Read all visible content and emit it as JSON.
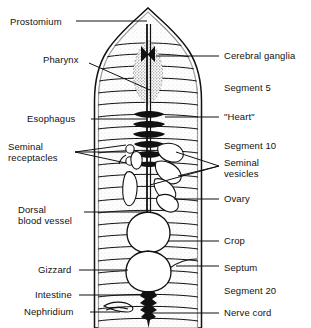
{
  "figure": {
    "organism": "earthworm",
    "view": "dorsal dissection",
    "ink_color": "#111111",
    "background_color": "#ffffff",
    "stipple_color": "#6e6e6e"
  },
  "labels_left": [
    {
      "id": "prostomium",
      "text": "Prostomium",
      "x": 10,
      "y": 16,
      "leader": "straight"
    },
    {
      "id": "pharynx",
      "text": "Pharynx",
      "x": 43,
      "y": 59,
      "leader": "diagonal"
    },
    {
      "id": "esophagus",
      "text": "Esophagus",
      "x": 27,
      "y": 114,
      "leader": "straight"
    },
    {
      "id": "seminal-receptacles",
      "text": "Seminal\nreceptacles",
      "x": 8,
      "y": 141,
      "leader": "fan3"
    },
    {
      "id": "dorsal-blood-vessel",
      "text": "Dorsal\nblood vessel",
      "x": 18,
      "y": 206,
      "leader": "straight"
    },
    {
      "id": "gizzard",
      "text": "Gizzard",
      "x": 38,
      "y": 265,
      "leader": "straight"
    },
    {
      "id": "intestine",
      "text": "Intestine",
      "x": 35,
      "y": 290,
      "leader": "straight"
    },
    {
      "id": "nephridium",
      "text": "Nephridium",
      "x": 24,
      "y": 308,
      "leader": "straight"
    }
  ],
  "labels_right": [
    {
      "id": "cerebral-ganglia",
      "text": "Cerebral ganglia",
      "x": 224,
      "y": 51,
      "leader": "straight"
    },
    {
      "id": "segment-5",
      "text": "Segment 5",
      "x": 224,
      "y": 83,
      "leader": "none"
    },
    {
      "id": "heart",
      "text": "\"Heart\"",
      "x": 224,
      "y": 112,
      "leader": "straight"
    },
    {
      "id": "segment-10",
      "text": "Segment 10",
      "x": 224,
      "y": 141,
      "leader": "none"
    },
    {
      "id": "seminal-vesicles",
      "text": "Seminal\nvesicles",
      "x": 224,
      "y": 157,
      "leader": "fan3"
    },
    {
      "id": "ovary",
      "text": "Ovary",
      "x": 224,
      "y": 194,
      "leader": "straight"
    },
    {
      "id": "crop",
      "text": "Crop",
      "x": 224,
      "y": 236,
      "leader": "straight"
    },
    {
      "id": "septum",
      "text": "Septum",
      "x": 224,
      "y": 263,
      "leader": "straight"
    },
    {
      "id": "segment-20",
      "text": "Segment 20",
      "x": 224,
      "y": 286,
      "leader": "none"
    },
    {
      "id": "nerve-cord",
      "text": "Nerve cord",
      "x": 224,
      "y": 308,
      "leader": "straight"
    }
  ],
  "anatomy": {
    "body": {
      "left": 97,
      "right": 198,
      "top": 10,
      "bottom": 328,
      "segment_count": 24
    },
    "structures": [
      "prostomium",
      "cerebral-ganglia",
      "pharynx",
      "esophagus",
      "hearts",
      "seminal-receptacles",
      "seminal-vesicles",
      "ovary",
      "crop",
      "gizzard",
      "intestine",
      "nephridium",
      "dorsal-blood-vessel",
      "nerve-cord",
      "septum"
    ]
  }
}
